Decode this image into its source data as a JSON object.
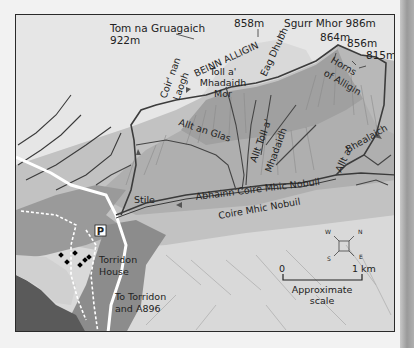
{
  "map": {
    "title_region": "Beinn Alligin",
    "colors": {
      "border": "#2a2a2a",
      "valley": "#d8d8d8",
      "mountain_light": "#b8b8b8",
      "mountain_mid": "#a4a4a4",
      "mountain_dark": "#8e8e8e",
      "woodland": "#8a8a8a",
      "loch": "#5c5c5c",
      "path": "#555555",
      "stream": "#444444",
      "road": "#ffffff"
    },
    "peaks": [
      {
        "name": "Tom na Gruagaich",
        "height": "922m"
      },
      {
        "name": "",
        "height": "858m"
      },
      {
        "name": "Sgurr Mhor",
        "height": "986m",
        "label": "Sgurr Mhor 986m"
      },
      {
        "name": "",
        "height": "864m"
      },
      {
        "name": "",
        "height": "856m"
      },
      {
        "name": "",
        "height": "815m"
      }
    ],
    "labels": {
      "mountain": "BEINN ALLIGIN",
      "coir_line1": "Coir' nan",
      "coir_line2": "Laogh",
      "toll_line1": "Toll a'",
      "toll_line2": "Mhadaidh",
      "toll_line3": "Mor",
      "eag": "Eag Dhubh",
      "horns_line1": "Horns",
      "horns_line2": "of Alligin",
      "allt_glas": "Allt an Glas",
      "allt_toll_line1": "Allt Toll a'",
      "allt_toll_line2": "Mhadaidh",
      "allt_bhealaich_line1": "Allt a'",
      "allt_bhealaich_line2": "Bhealaich",
      "abhainn": "Abhainn Coire Mhic Nobuil",
      "coire": "Coire Mhic Nobuil",
      "stile": "Stile",
      "parking": "P",
      "torridon_house_line1": "Torridon",
      "torridon_house_line2": "House",
      "to_torridon_line1": "To Torridon",
      "to_torridon_line2": "and A896"
    },
    "compass": {
      "n": "N",
      "e": "E",
      "s": "S",
      "w": "W"
    },
    "scale": {
      "start": "0",
      "end": "1 km",
      "caption_line1": "Approximate",
      "caption_line2": "scale"
    }
  }
}
